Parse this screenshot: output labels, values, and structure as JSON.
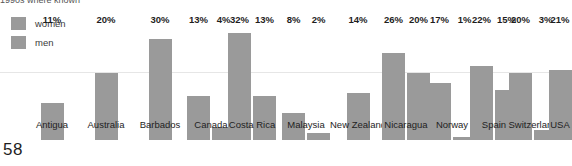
{
  "caption": {
    "text": "1990s where known"
  },
  "page": {
    "number": "58"
  },
  "legend": {
    "items": [
      {
        "label": "women",
        "color": "#9a9a9a"
      },
      {
        "label": "men",
        "color": "#9a9a9a"
      }
    ]
  },
  "chart_data": {
    "type": "bar",
    "title": "",
    "subtitle": "1990s where known",
    "xlabel": "",
    "ylabel": "",
    "ylim": [
      0,
      34
    ],
    "grid": true,
    "gridlines": [
      20
    ],
    "legend_position": "top-left",
    "categories": [
      "Antigua",
      "Australia",
      "Barbados",
      "Canada",
      "Costa Rica",
      "Malaysia",
      "New Zealand",
      "Nicaragua",
      "Norway",
      "Spain",
      "Switzerland",
      "USA"
    ],
    "series": [
      {
        "name": "women",
        "values": [
          11,
          20,
          30,
          13,
          32,
          8,
          14,
          26,
          17,
          22,
          20,
          21
        ],
        "labels": [
          "11%",
          "20%",
          "30%",
          "13%",
          "32%",
          "8%",
          "14%",
          "26%",
          "17%",
          "22%",
          "20%",
          "21%"
        ]
      },
      {
        "name": "men",
        "values": [
          null,
          null,
          null,
          4,
          13,
          2,
          null,
          20,
          1,
          15,
          3,
          null
        ],
        "labels": [
          "",
          "",
          "",
          "4%",
          "13%",
          "2%",
          "",
          "20%",
          "1%",
          "15%",
          "3%",
          ""
        ]
      }
    ]
  }
}
